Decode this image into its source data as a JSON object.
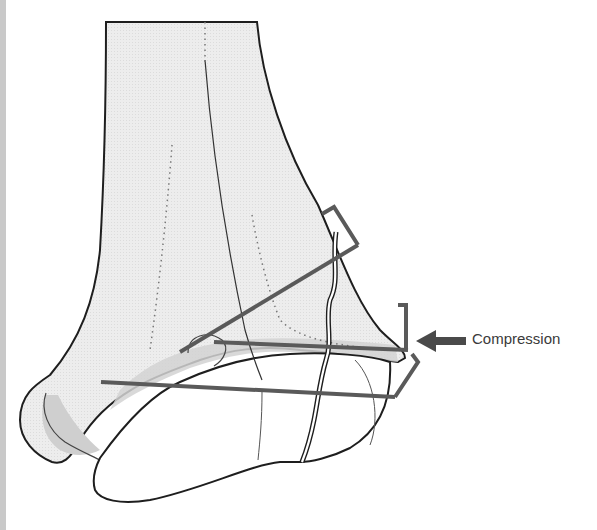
{
  "figure": {
    "labels": {
      "compression": "Compression"
    },
    "colors": {
      "bone_fill": "#ececec",
      "bone_shade": "#d4d4d4",
      "outline": "#1e1e1e",
      "rod": "#5a5a5a",
      "edge_strip": "#c9c9c9",
      "label_text": "#3a3a3a"
    },
    "elements": [
      "tibia-shaft",
      "talus",
      "fracture-line",
      "screw-line-upper",
      "screw-line-middle",
      "screw-line-lower",
      "bracket-upper",
      "bracket-middle",
      "bracket-lower",
      "compression-arrow"
    ]
  }
}
